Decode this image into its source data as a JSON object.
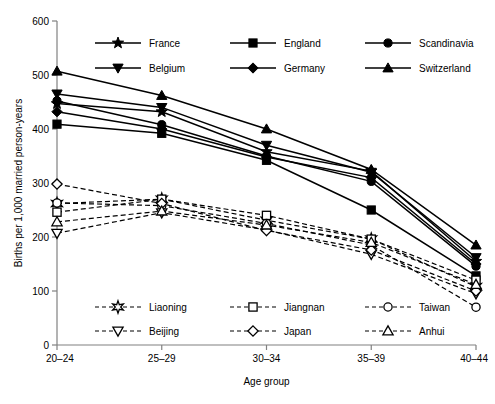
{
  "chart_data": {
    "type": "line",
    "title": "",
    "xlabel": "Age group",
    "ylabel": "Births per 1,000 married person-years",
    "categories": [
      "20–24",
      "25–29",
      "30–34",
      "35–39",
      "40–44"
    ],
    "x": [
      0,
      1,
      2,
      3,
      4
    ],
    "ylim": [
      0,
      600
    ],
    "yticks": [
      0,
      100,
      200,
      300,
      400,
      500,
      600
    ],
    "yticklabels": [
      "0",
      "100",
      "200",
      "300",
      "400",
      "500",
      "600"
    ],
    "grid": false,
    "legend_position": "inside-top and inside-bottom",
    "series": [
      {
        "name": "France",
        "group": "europe",
        "marker": "star",
        "fill": "filled",
        "linestyle": "solid",
        "values": [
          447,
          432,
          358,
          322,
          155
        ]
      },
      {
        "name": "England",
        "group": "europe",
        "marker": "square",
        "fill": "filled",
        "linestyle": "solid",
        "values": [
          409,
          392,
          342,
          250,
          128
        ]
      },
      {
        "name": "Scandinavia",
        "group": "europe",
        "marker": "circle",
        "fill": "filled",
        "linestyle": "solid",
        "values": [
          452,
          408,
          350,
          303,
          146
        ]
      },
      {
        "name": "Belgium",
        "group": "europe",
        "marker": "triangle-down",
        "fill": "filled",
        "linestyle": "solid",
        "values": [
          465,
          440,
          370,
          320,
          162
        ]
      },
      {
        "name": "Germany",
        "group": "europe",
        "marker": "diamond",
        "fill": "filled",
        "linestyle": "solid",
        "values": [
          432,
          400,
          348,
          310,
          150
        ]
      },
      {
        "name": "Switzerland",
        "group": "europe",
        "marker": "triangle-up",
        "fill": "filled",
        "linestyle": "solid",
        "values": [
          507,
          462,
          400,
          325,
          185
        ]
      },
      {
        "name": "Liaoning",
        "group": "asia",
        "marker": "asterisk",
        "fill": "open",
        "linestyle": "dashed",
        "values": [
          262,
          270,
          231,
          196,
          108
        ]
      },
      {
        "name": "Jiangnan",
        "group": "asia",
        "marker": "square",
        "fill": "open",
        "linestyle": "dashed",
        "values": [
          246,
          270,
          240,
          196,
          120
        ]
      },
      {
        "name": "Taiwan",
        "group": "asia",
        "marker": "circle",
        "fill": "open",
        "linestyle": "dashed",
        "values": [
          263,
          258,
          225,
          185,
          70
        ]
      },
      {
        "name": "Beijing",
        "group": "asia",
        "marker": "triangle-down",
        "fill": "open",
        "linestyle": "dashed",
        "values": [
          207,
          245,
          213,
          168,
          95
        ]
      },
      {
        "name": "Japan",
        "group": "asia",
        "marker": "diamond",
        "fill": "open",
        "linestyle": "dashed",
        "values": [
          298,
          262,
          212,
          176,
          100
        ]
      },
      {
        "name": "Anhui",
        "group": "asia",
        "marker": "triangle-up",
        "fill": "open",
        "linestyle": "dashed",
        "values": [
          228,
          248,
          222,
          190,
          112
        ]
      }
    ]
  },
  "legend_top": {
    "rows": [
      [
        {
          "label": "France",
          "marker": "star",
          "fill": "filled",
          "linestyle": "solid"
        },
        {
          "label": "England",
          "marker": "square",
          "fill": "filled",
          "linestyle": "solid"
        },
        {
          "label": "Scandinavia",
          "marker": "circle",
          "fill": "filled",
          "linestyle": "solid"
        }
      ],
      [
        {
          "label": "Belgium",
          "marker": "triangle-down",
          "fill": "filled",
          "linestyle": "solid"
        },
        {
          "label": "Germany",
          "marker": "diamond",
          "fill": "filled",
          "linestyle": "solid"
        },
        {
          "label": "Switzerland",
          "marker": "triangle-up",
          "fill": "filled",
          "linestyle": "solid"
        }
      ]
    ]
  },
  "legend_bottom": {
    "rows": [
      [
        {
          "label": "Liaoning",
          "marker": "asterisk",
          "fill": "open",
          "linestyle": "dashed"
        },
        {
          "label": "Jiangnan",
          "marker": "square",
          "fill": "open",
          "linestyle": "dashed"
        },
        {
          "label": "Taiwan",
          "marker": "circle",
          "fill": "open",
          "linestyle": "dashed"
        }
      ],
      [
        {
          "label": "Beijing",
          "marker": "triangle-down",
          "fill": "open",
          "linestyle": "dashed"
        },
        {
          "label": "Japan",
          "marker": "diamond",
          "fill": "open",
          "linestyle": "dashed"
        },
        {
          "label": "Anhui",
          "marker": "triangle-up",
          "fill": "open",
          "linestyle": "dashed"
        }
      ]
    ]
  }
}
